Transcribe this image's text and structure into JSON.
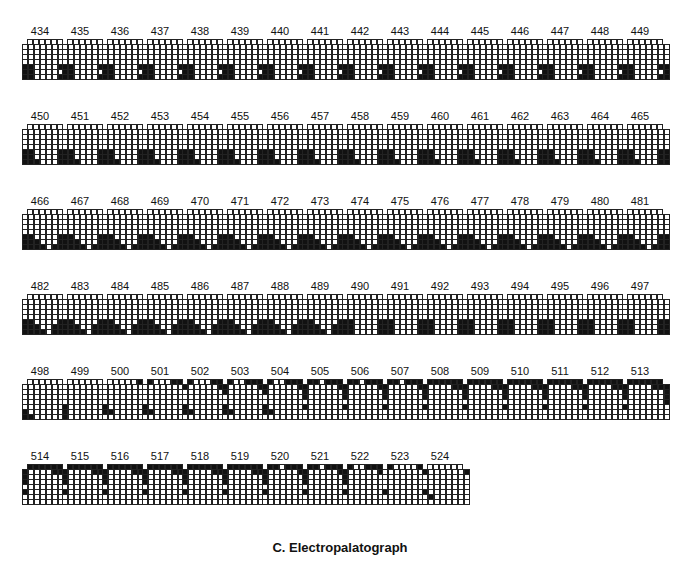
{
  "title": "C. Electropalatograph",
  "layout": {
    "x0": 22,
    "dx": 40,
    "row_y": [
      39,
      124,
      209,
      294,
      379,
      464
    ],
    "per_row": 16
  },
  "legend": {
    "contact": "#111111",
    "no_contact": "#ffffff"
  },
  "patterns": {
    "A": [
      "000000",
      "00000000",
      "00000000",
      "00000000",
      "00000000",
      "11000011",
      "11000001",
      "11000011"
    ],
    "B": [
      "000000",
      "00000000",
      "00000000",
      "00000000",
      "00000000",
      "11000011",
      "11000011",
      "11100011"
    ],
    "C": [
      "000000",
      "00000000",
      "00000000",
      "00000000",
      "00000000",
      "11000011",
      "11100011",
      "11110111"
    ],
    "D": [
      "000000",
      "00000000",
      "00000000",
      "00000000",
      "00000000",
      "11000011",
      "11100111",
      "11110111"
    ],
    "E": [
      "000000",
      "00000000",
      "00000000",
      "00000000",
      "00000000",
      "11000011",
      "11000011",
      "11000011"
    ],
    "F": [
      "000000",
      "00000000",
      "00000000",
      "00000000",
      "00000000",
      "00000000",
      "10000000",
      "11000000"
    ],
    "G": [
      "000000",
      "00000000",
      "00000000",
      "00000000",
      "00000000",
      "10000000",
      "10000000",
      "10000000"
    ],
    "H": [
      "000001",
      "00000001",
      "00000000",
      "00000000",
      "00000000",
      "10000000",
      "11000000",
      "00000000"
    ],
    "I": [
      "100011",
      "00000001",
      "00000000",
      "00000000",
      "00000000",
      "10000000",
      "11000000",
      "00000000"
    ],
    "J": [
      "100011",
      "10000011",
      "00000001",
      "00000000",
      "00000000",
      "10000000",
      "11000000",
      "00000000"
    ],
    "K": [
      "100111",
      "10000011",
      "10000001",
      "00000000",
      "00000000",
      "10000000",
      "11000000",
      "00000000"
    ],
    "L": [
      "110111",
      "10000011",
      "10000001",
      "10000001",
      "00000000",
      "10000000",
      "00000000",
      "00000000"
    ],
    "M": [
      "111111",
      "10000111",
      "10000001",
      "10000001",
      "00000001",
      "10000000",
      "00000000",
      "00000000"
    ],
    "N": [
      "100111",
      "10000011",
      "10000001",
      "10000001",
      "00000000",
      "10000000",
      "00000000",
      "00000000"
    ],
    "O": [
      "100001",
      "00000001",
      "00000000",
      "00000000",
      "00000000",
      "10000000",
      "00000000",
      "00000000"
    ],
    "P": [
      "000000",
      "10000001",
      "00000000",
      "00000000",
      "00000000",
      "10000000",
      "01000000",
      "00000000"
    ]
  },
  "frames": [
    {
      "n": "434",
      "p": "A"
    },
    {
      "n": "435",
      "p": "A"
    },
    {
      "n": "436",
      "p": "A"
    },
    {
      "n": "437",
      "p": "A"
    },
    {
      "n": "438",
      "p": "A"
    },
    {
      "n": "439",
      "p": "A"
    },
    {
      "n": "440",
      "p": "A"
    },
    {
      "n": "441",
      "p": "A"
    },
    {
      "n": "442",
      "p": "A"
    },
    {
      "n": "443",
      "p": "A"
    },
    {
      "n": "444",
      "p": "A"
    },
    {
      "n": "445",
      "p": "A"
    },
    {
      "n": "446",
      "p": "A"
    },
    {
      "n": "447",
      "p": "A"
    },
    {
      "n": "448",
      "p": "A"
    },
    {
      "n": "449",
      "p": "A"
    },
    {
      "n": "450",
      "p": "B"
    },
    {
      "n": "451",
      "p": "B"
    },
    {
      "n": "452",
      "p": "B"
    },
    {
      "n": "453",
      "p": "B"
    },
    {
      "n": "454",
      "p": "B"
    },
    {
      "n": "455",
      "p": "B"
    },
    {
      "n": "456",
      "p": "B"
    },
    {
      "n": "457",
      "p": "B"
    },
    {
      "n": "458",
      "p": "B"
    },
    {
      "n": "459",
      "p": "B"
    },
    {
      "n": "460",
      "p": "B"
    },
    {
      "n": "461",
      "p": "B"
    },
    {
      "n": "462",
      "p": "B"
    },
    {
      "n": "463",
      "p": "B"
    },
    {
      "n": "464",
      "p": "B"
    },
    {
      "n": "465",
      "p": "B"
    },
    {
      "n": "466",
      "p": "C"
    },
    {
      "n": "467",
      "p": "C"
    },
    {
      "n": "468",
      "p": "C"
    },
    {
      "n": "469",
      "p": "C"
    },
    {
      "n": "470",
      "p": "C"
    },
    {
      "n": "471",
      "p": "C"
    },
    {
      "n": "472",
      "p": "C"
    },
    {
      "n": "473",
      "p": "C"
    },
    {
      "n": "474",
      "p": "C"
    },
    {
      "n": "475",
      "p": "C"
    },
    {
      "n": "476",
      "p": "C"
    },
    {
      "n": "477",
      "p": "C"
    },
    {
      "n": "478",
      "p": "C"
    },
    {
      "n": "479",
      "p": "C"
    },
    {
      "n": "480",
      "p": "C"
    },
    {
      "n": "481",
      "p": "C"
    },
    {
      "n": "482",
      "p": "D"
    },
    {
      "n": "483",
      "p": "D"
    },
    {
      "n": "484",
      "p": "D"
    },
    {
      "n": "485",
      "p": "D"
    },
    {
      "n": "486",
      "p": "D"
    },
    {
      "n": "487",
      "p": "D"
    },
    {
      "n": "488",
      "p": "D"
    },
    {
      "n": "489",
      "p": "D"
    },
    {
      "n": "490",
      "p": "E"
    },
    {
      "n": "491",
      "p": "E"
    },
    {
      "n": "492",
      "p": "E"
    },
    {
      "n": "493",
      "p": "E"
    },
    {
      "n": "494",
      "p": "E"
    },
    {
      "n": "495",
      "p": "E"
    },
    {
      "n": "496",
      "p": "E"
    },
    {
      "n": "497",
      "p": "E"
    },
    {
      "n": "498",
      "p": "F"
    },
    {
      "n": "499",
      "p": "G"
    },
    {
      "n": "500",
      "p": "H"
    },
    {
      "n": "501",
      "p": "I"
    },
    {
      "n": "502",
      "p": "J"
    },
    {
      "n": "503",
      "p": "K"
    },
    {
      "n": "504",
      "p": "K"
    },
    {
      "n": "505",
      "p": "L"
    },
    {
      "n": "506",
      "p": "L"
    },
    {
      "n": "507",
      "p": "L"
    },
    {
      "n": "508",
      "p": "M"
    },
    {
      "n": "509",
      "p": "M"
    },
    {
      "n": "510",
      "p": "M"
    },
    {
      "n": "511",
      "p": "M"
    },
    {
      "n": "512",
      "p": "M"
    },
    {
      "n": "513",
      "p": "M"
    },
    {
      "n": "514",
      "p": "M"
    },
    {
      "n": "515",
      "p": "M"
    },
    {
      "n": "516",
      "p": "M"
    },
    {
      "n": "517",
      "p": "M"
    },
    {
      "n": "518",
      "p": "M"
    },
    {
      "n": "519",
      "p": "M"
    },
    {
      "n": "520",
      "p": "L"
    },
    {
      "n": "521",
      "p": "L"
    },
    {
      "n": "522",
      "p": "N"
    },
    {
      "n": "523",
      "p": "O"
    },
    {
      "n": "524",
      "p": "P"
    }
  ]
}
